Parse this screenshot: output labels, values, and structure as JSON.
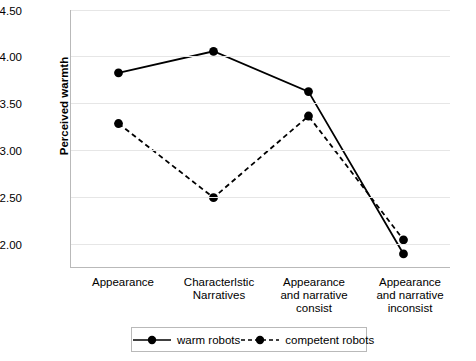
{
  "chart_data": {
    "type": "line",
    "title": "",
    "xlabel": "",
    "ylabel": "Perceived warmth",
    "categories": [
      "Appearance",
      "Characterlstic\nNarratives",
      "Appearance\nand narrative\nconsist",
      "Appearance\nand narrative\ninconsist"
    ],
    "category_lines": [
      [
        "Appearance"
      ],
      [
        "Characterlstic",
        "Narratives"
      ],
      [
        "Appearance",
        "and narrative",
        "consist"
      ],
      [
        "Appearance",
        "and narrative",
        "inconsist"
      ]
    ],
    "ylim": [
      1.75,
      4.5
    ],
    "yticks": [
      "2.00",
      "2.50",
      "3.00",
      "3.50",
      "4.00",
      "4.50"
    ],
    "ytick_values": [
      2.0,
      2.5,
      3.0,
      3.5,
      4.0,
      4.5
    ],
    "grid": "horizontal",
    "legend_position": "bottom",
    "series": [
      {
        "name": "warm robots",
        "values": [
          3.83,
          4.06,
          3.63,
          1.9
        ],
        "line_style": "solid",
        "color": "#000000",
        "marker": "filled-circle"
      },
      {
        "name": "competent robots",
        "values": [
          3.29,
          2.5,
          3.37,
          2.05
        ],
        "line_style": "dashed",
        "color": "#000000",
        "marker": "filled-circle"
      }
    ]
  },
  "legend": {
    "entries": [
      {
        "label": "warm robots",
        "style": "solid"
      },
      {
        "label": "competent robots",
        "style": "dashed"
      }
    ]
  }
}
